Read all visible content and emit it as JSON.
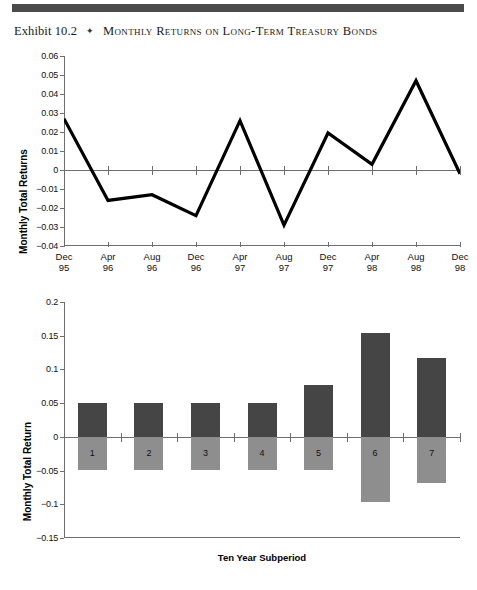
{
  "header": {
    "exhibit_label": "Exhibit 10.2",
    "bullet": "✦",
    "title": "Monthly Returns on Long-Term Treasury Bonds"
  },
  "chart_data": [
    {
      "type": "line",
      "title": "",
      "xlabel": "",
      "ylabel": "Monthly Total Returns",
      "ylim": [
        -0.04,
        0.06
      ],
      "yticks": [
        0.06,
        0.05,
        0.04,
        0.03,
        0.02,
        0.01,
        0,
        -0.01,
        -0.02,
        -0.03,
        -0.04
      ],
      "ytick_labels": [
        "0.06",
        "0.05",
        "0.04",
        "0.03",
        "0.02",
        "0.01",
        "0",
        "−0.01",
        "−0.02",
        "−0.03",
        "−0.04"
      ],
      "categories": [
        "Dec\n95",
        "Apr\n96",
        "Aug\n96",
        "Dec\n96",
        "Apr\n97",
        "Aug\n97",
        "Dec\n97",
        "Apr\n98",
        "Aug\n98",
        "Dec\n98"
      ],
      "values": [
        0.027,
        -0.016,
        -0.013,
        -0.024,
        0.026,
        -0.029,
        0.0195,
        0.003,
        0.047,
        -0.002
      ],
      "grid": false,
      "legend": "none",
      "line_color": "#000000"
    },
    {
      "type": "bar",
      "title": "",
      "xlabel": "Ten Year Subperiod",
      "ylabel": "Monthly Total Return",
      "ylim": [
        -0.15,
        0.2
      ],
      "yticks": [
        0.2,
        0.15,
        0.1,
        0.05,
        0,
        -0.05,
        -0.1,
        -0.15
      ],
      "ytick_labels": [
        "0.2",
        "0.15",
        "0.1",
        "0.05",
        "0",
        "−0.05",
        "−0.1",
        "−0.15"
      ],
      "categories": [
        "1",
        "2",
        "3",
        "4",
        "5",
        "6",
        "7"
      ],
      "series": [
        {
          "name": "positive",
          "color": "#454545",
          "values": [
            0.05,
            0.05,
            0.05,
            0.051,
            0.077,
            0.154,
            0.117
          ]
        },
        {
          "name": "negative",
          "color": "#8e8e8e",
          "values": [
            -0.049,
            -0.049,
            -0.049,
            -0.049,
            -0.049,
            -0.097,
            -0.069
          ]
        }
      ],
      "grid": false,
      "legend": "none"
    }
  ]
}
